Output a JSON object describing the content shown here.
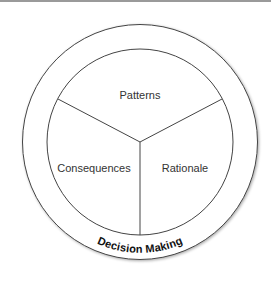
{
  "diagram": {
    "outer_label": "Decision Making",
    "segments": [
      {
        "label": "Patterns"
      },
      {
        "label": "Consequences"
      },
      {
        "label": "Rationale"
      }
    ]
  }
}
